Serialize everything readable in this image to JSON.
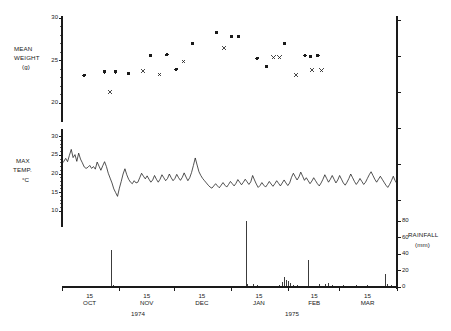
{
  "figure": {
    "background": "#ffffff",
    "ink": "#1a1a1a"
  },
  "panels": {
    "weight": {
      "axis_label_line1": "MEAN",
      "axis_label_line2": "WEIGHT",
      "axis_label_line3": "(g)",
      "ticks": [
        "30",
        "25",
        "20"
      ]
    },
    "temperature": {
      "axis_label_line1": "MAX",
      "axis_label_line2": "TEMP.",
      "axis_label_line3": "°C",
      "ticks": [
        "30",
        "25",
        "20",
        "15",
        "10"
      ]
    },
    "rainfall": {
      "axis_label_line1": "RAINFALL",
      "axis_label_line2": "(mm)",
      "ticks": [
        "80",
        "60",
        "40",
        "20",
        "0"
      ]
    }
  },
  "xaxis": {
    "month_ticks": [
      {
        "day": "15",
        "month": "OCT"
      },
      {
        "day": "15",
        "month": "NOV"
      },
      {
        "day": "15",
        "month": "DEC"
      },
      {
        "day": "15",
        "month": "JAN"
      },
      {
        "day": "15",
        "month": "FEB"
      },
      {
        "day": "15",
        "month": "MAR"
      }
    ],
    "years": [
      "1974",
      "1975"
    ]
  },
  "chart_data": {
    "type": "scatter",
    "title": "",
    "xlabel": "",
    "grid": false,
    "legend": "none",
    "x_range_days": [
      0,
      182
    ],
    "x_start_date": "1974-10-01",
    "x_end_date": "1975-03-31",
    "panels": [
      {
        "name": "mean_weight",
        "type": "scatter",
        "ylabel": "MEAN WEIGHT (g)",
        "ylim": [
          19,
          30
        ],
        "yticks": [
          20,
          25,
          30
        ],
        "series": [
          {
            "name": "filled-circle",
            "marker": "circle",
            "points": [
              [
                12,
                23.3
              ],
              [
                23,
                23.7
              ],
              [
                29,
                23.7
              ],
              [
                48,
                25.6
              ],
              [
                57,
                25.7
              ],
              [
                71,
                27.0
              ],
              [
                84,
                28.3
              ],
              [
                92,
                27.8
              ],
              [
                96,
                27.8
              ],
              [
                106,
                25.3
              ],
              [
                111,
                24.3
              ],
              [
                121,
                27.0
              ],
              [
                132,
                25.6
              ],
              [
                135,
                25.5
              ],
              [
                139,
                25.6
              ],
              [
                36,
                23.5
              ],
              [
                62,
                24.0
              ]
            ]
          },
          {
            "name": "cross",
            "marker": "cross",
            "points": [
              [
                26,
                21.3
              ],
              [
                44,
                23.8
              ],
              [
                53,
                23.4
              ],
              [
                66,
                24.9
              ],
              [
                88,
                26.5
              ],
              [
                115,
                25.4
              ],
              [
                118,
                25.4
              ],
              [
                127,
                23.3
              ],
              [
                136,
                23.9
              ],
              [
                141,
                23.9
              ]
            ]
          }
        ]
      },
      {
        "name": "max_temperature",
        "type": "line",
        "ylabel": "MAX TEMP. °C",
        "yunit": "°C",
        "ylim": [
          9,
          31
        ],
        "yticks": [
          10,
          15,
          20,
          25,
          30
        ],
        "values": [
          22.8,
          23.4,
          24.2,
          23.3,
          25.0,
          26.6,
          24.4,
          25.2,
          23.4,
          25.6,
          24.0,
          23.0,
          21.9,
          21.5,
          21.8,
          22.3,
          21.5,
          22.0,
          21.3,
          23.2,
          22.1,
          21.0,
          22.2,
          23.3,
          22.0,
          20.2,
          18.9,
          17.6,
          16.0,
          15.0,
          14.0,
          16.2,
          18.0,
          20.0,
          21.4,
          19.8,
          18.6,
          17.8,
          17.4,
          18.2,
          17.6,
          17.8,
          19.0,
          20.2,
          19.4,
          18.7,
          19.5,
          18.6,
          17.8,
          18.4,
          19.6,
          18.6,
          17.8,
          18.6,
          19.8,
          19.0,
          18.2,
          18.8,
          20.0,
          19.0,
          18.2,
          18.8,
          19.9,
          19.0,
          18.3,
          19.1,
          20.3,
          19.2,
          18.2,
          19.0,
          20.4,
          22.3,
          24.3,
          22.4,
          20.6,
          19.6,
          18.8,
          18.2,
          17.6,
          17.0,
          16.5,
          16.2,
          16.8,
          17.4,
          16.8,
          16.3,
          17.0,
          17.7,
          17.0,
          16.5,
          17.2,
          18.0,
          17.4,
          16.8,
          17.5,
          18.5,
          17.8,
          17.1,
          17.8,
          18.6,
          17.9,
          17.2,
          17.9,
          19.6,
          18.4,
          17.3,
          16.4,
          16.9,
          17.7,
          17.0,
          16.5,
          17.2,
          18.0,
          17.3,
          16.7,
          17.4,
          18.2,
          17.5,
          16.8,
          17.6,
          18.4,
          17.6,
          16.9,
          17.6,
          19.1,
          20.2,
          19.3,
          18.4,
          19.2,
          20.5,
          19.4,
          18.3,
          19.0,
          18.2,
          17.4,
          18.1,
          19.0,
          18.2,
          17.4,
          16.8,
          17.6,
          18.6,
          19.8,
          18.8,
          17.8,
          18.6,
          19.6,
          18.6,
          17.6,
          18.4,
          19.6,
          18.6,
          17.6,
          17.0,
          17.8,
          18.8,
          20.0,
          19.0,
          18.0,
          17.2,
          17.9,
          18.8,
          18.0,
          17.2,
          17.8,
          18.8,
          19.8,
          20.6,
          19.6,
          18.6,
          17.8,
          18.6,
          19.4,
          18.6,
          17.8,
          17.0,
          16.4,
          17.2,
          18.2,
          19.4,
          18.2,
          17.4
        ]
      },
      {
        "name": "rainfall",
        "type": "bar",
        "ylabel": "RAINFALL (mm)",
        "yunit": "mm",
        "ylim": [
          0,
          90
        ],
        "yticks": [
          0,
          20,
          40,
          60,
          80
        ],
        "bars": [
          [
            2,
            1.0
          ],
          [
            10,
            0.8
          ],
          [
            22,
            1.2
          ],
          [
            27,
            45.0
          ],
          [
            28,
            3.0
          ],
          [
            33,
            1.0
          ],
          [
            45,
            1.5
          ],
          [
            52,
            1.0
          ],
          [
            60,
            1.0
          ],
          [
            68,
            1.0
          ],
          [
            79,
            1.5
          ],
          [
            88,
            1.0
          ],
          [
            100,
            80.0
          ],
          [
            101,
            4.0
          ],
          [
            104,
            3.5
          ],
          [
            106,
            2.0
          ],
          [
            118,
            3.0
          ],
          [
            120,
            6.0
          ],
          [
            121,
            12.0
          ],
          [
            122,
            9.0
          ],
          [
            123,
            7.0
          ],
          [
            124,
            5.0
          ],
          [
            126,
            3.0
          ],
          [
            128,
            2.0
          ],
          [
            134,
            33.0
          ],
          [
            140,
            3.5
          ],
          [
            143,
            4.0
          ],
          [
            145,
            5.0
          ],
          [
            147,
            3.0
          ],
          [
            153,
            2.5
          ],
          [
            160,
            2.0
          ],
          [
            166,
            2.5
          ],
          [
            176,
            16.0
          ],
          [
            177,
            4.0
          ],
          [
            179,
            3.0
          ]
        ]
      }
    ]
  }
}
